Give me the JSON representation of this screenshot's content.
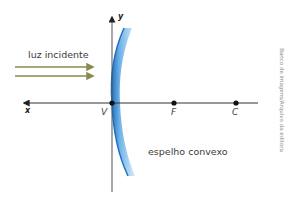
{
  "diagram": {
    "title": "Espelho convexo",
    "labels": {
      "incident_light": "luz incidente",
      "mirror": "espelho convexo",
      "x_axis": "x",
      "y_axis": "y",
      "vertex": "V",
      "focus": "F",
      "center": "C"
    },
    "credit": "Banco de imagens/Arquivo da editora",
    "colors": {
      "mirror_fill": "#7ab8e8",
      "mirror_edge": "#1e6fc0",
      "light_rays": "#8a8a4e",
      "axes": "#333333",
      "points": "#111111"
    }
  }
}
